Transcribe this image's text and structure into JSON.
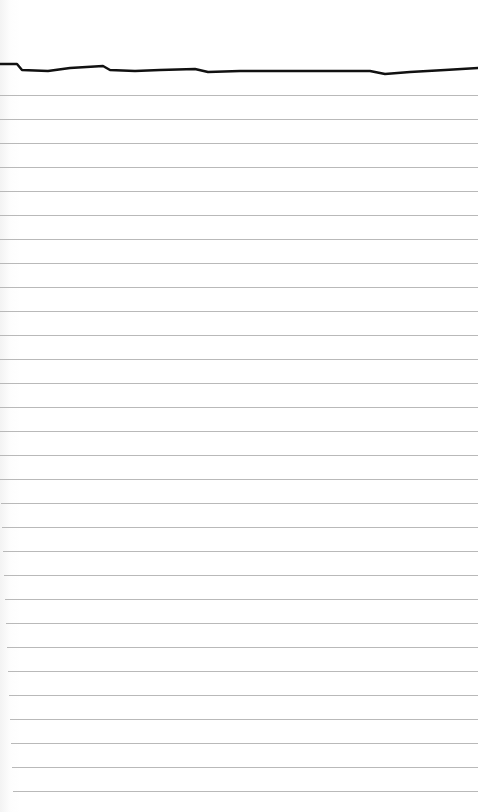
{
  "paper": {
    "type": "lined-paper",
    "background_color": "#ffffff",
    "rule_color": "#b9b9b9",
    "first_rule_y": 95,
    "rule_spacing": 24,
    "rule_count": 30
  },
  "drawn_line": {
    "color": "#111111",
    "width": 2.5,
    "points": [
      [
        0,
        64
      ],
      [
        17,
        64
      ],
      [
        22,
        70
      ],
      [
        48,
        71
      ],
      [
        70,
        68
      ],
      [
        103,
        66
      ],
      [
        110,
        70
      ],
      [
        135,
        71
      ],
      [
        160,
        70
      ],
      [
        195,
        69
      ],
      [
        208,
        72
      ],
      [
        240,
        71
      ],
      [
        280,
        71
      ],
      [
        330,
        71
      ],
      [
        370,
        71
      ],
      [
        385,
        74
      ],
      [
        410,
        72
      ],
      [
        445,
        70
      ],
      [
        478,
        68
      ]
    ]
  }
}
